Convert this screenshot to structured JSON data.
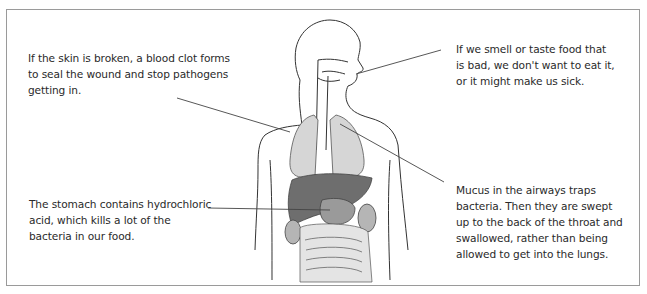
{
  "diagram": {
    "labels": [
      {
        "id": "skin",
        "text": "If the skin is broken, a blood clot forms to seal the wound and stop pathogens getting in."
      },
      {
        "id": "smell-taste",
        "text": "If we smell or taste food that is bad, we don't want to eat it, or it might make us sick."
      },
      {
        "id": "stomach",
        "text": "The stomach contains hydrochloric acid, which kills a lot of the bacteria in our food."
      },
      {
        "id": "mucus",
        "text": "Mucus in the airways traps bacteria. Then they are swept up to the back of the throat and swallowed, rather than being allowed to get into the lungs."
      }
    ],
    "colors": {
      "border": "#9a9a9a",
      "text": "#2a2a2a",
      "outline": "#333333",
      "lung": "#d6d6d6",
      "liver": "#6e6e6e",
      "stomach": "#9a9a9a",
      "intestine": "#e4e4e4"
    }
  }
}
